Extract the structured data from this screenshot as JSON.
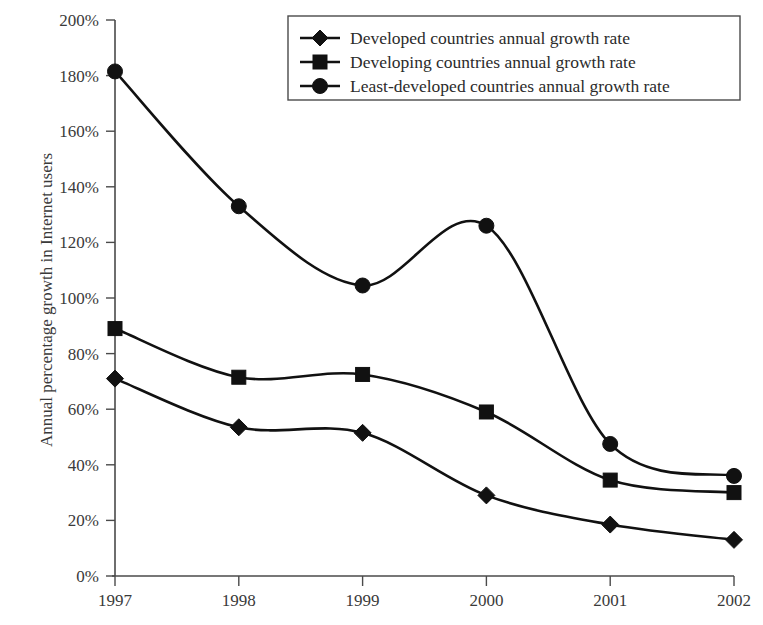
{
  "chart_data": {
    "type": "line",
    "title": "",
    "subtitle": "",
    "xlabel": "",
    "ylabel": "Annual percentage growth in Internet users",
    "categories": [
      "1997",
      "1998",
      "1999",
      "2000",
      "2001",
      "2002"
    ],
    "x": [
      1997,
      1998,
      1999,
      2000,
      2001,
      2002
    ],
    "ylim": [
      0,
      200
    ],
    "xlim": [
      1997,
      2002
    ],
    "y_tick_labels": [
      "0%",
      "20%",
      "40%",
      "60%",
      "80%",
      "100%",
      "120%",
      "140%",
      "160%",
      "180%",
      "200%"
    ],
    "y_tick_values": [
      0,
      20,
      40,
      60,
      80,
      100,
      120,
      140,
      160,
      180,
      200
    ],
    "y_tick_step": 20,
    "x_tick_labels": [
      "1997",
      "1998",
      "1999",
      "2000",
      "2001",
      "2002"
    ],
    "grid": false,
    "legend_position": "top-right",
    "value_unit": "%",
    "series": [
      {
        "name": "Developed countries annual growth rate",
        "marker": "diamond",
        "color": "#111111",
        "values": [
          71,
          53.5,
          51.5,
          29,
          18.5,
          13
        ]
      },
      {
        "name": "Developing countries annual growth rate",
        "marker": "square",
        "color": "#111111",
        "values": [
          89,
          71.5,
          72.5,
          59,
          34.5,
          30
        ]
      },
      {
        "name": "Least-developed countries annual growth rate",
        "marker": "circle",
        "color": "#111111",
        "values": [
          181.5,
          133,
          104.5,
          126,
          47.5,
          36
        ]
      }
    ],
    "annotations": []
  },
  "legend": {
    "entries": [
      {
        "label": "Developed countries annual growth rate",
        "marker": "diamond-marker"
      },
      {
        "label": "Developing countries annual growth rate",
        "marker": "square-marker"
      },
      {
        "label": "Least-developed countries annual growth rate",
        "marker": "circle-marker"
      }
    ]
  },
  "axes": {
    "y_axis_title": "Annual percentage growth in Internet users",
    "y_ticks": [
      "200%",
      "180%",
      "160%",
      "140%",
      "120%",
      "100%",
      "80%",
      "60%",
      "40%",
      "20%",
      "0%"
    ],
    "x_ticks": [
      "1997",
      "1998",
      "1999",
      "2000",
      "2001",
      "2002"
    ]
  },
  "colors": {
    "line": "#111111",
    "axis": "#4a4a4a",
    "text": "#2b2b2b",
    "background": "#ffffff"
  }
}
